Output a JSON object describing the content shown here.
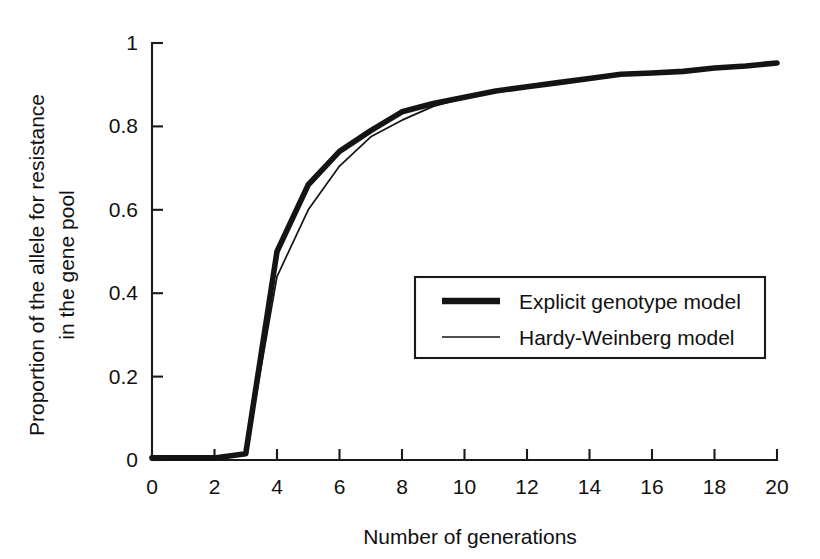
{
  "chart_data": {
    "type": "line",
    "title": "",
    "xlabel": "Number of generations",
    "ylabel": "Proportion of the allele for resistance in the gene pool",
    "ylabel_line1": "Proportion of the allele for resistance",
    "ylabel_line2": "in the gene pool",
    "xlim": [
      0,
      20
    ],
    "ylim": [
      0,
      1
    ],
    "xticks": [
      0,
      2,
      4,
      6,
      8,
      10,
      12,
      14,
      16,
      18,
      20
    ],
    "xtick_labels": [
      "0",
      "2",
      "4",
      "6",
      "8",
      "10",
      "12",
      "14",
      "16",
      "18",
      "20"
    ],
    "yticks": [
      0,
      0.2,
      0.4,
      0.6,
      0.8,
      1
    ],
    "ytick_labels": [
      "0",
      "0.2",
      "0.4",
      "0.6",
      "0.8",
      "1"
    ],
    "grid": false,
    "legend_position": "center-right",
    "x": [
      0,
      1,
      2,
      3,
      4,
      5,
      6,
      7,
      8,
      9,
      10,
      11,
      12,
      13,
      14,
      15,
      16,
      17,
      18,
      19,
      20
    ],
    "series": [
      {
        "name": "Explicit genotype model",
        "style": "thick",
        "color": "#141414",
        "values": [
          0.005,
          0.005,
          0.005,
          0.015,
          0.5,
          0.66,
          0.74,
          0.79,
          0.835,
          0.855,
          0.87,
          0.885,
          0.895,
          0.905,
          0.915,
          0.925,
          0.928,
          0.932,
          0.94,
          0.945,
          0.952
        ]
      },
      {
        "name": "Hardy-Weinberg model",
        "style": "thin",
        "color": "#141414",
        "values": [
          0.005,
          0.005,
          0.005,
          0.012,
          0.44,
          0.6,
          0.705,
          0.775,
          0.815,
          0.848,
          0.868,
          0.884,
          0.894,
          0.904,
          0.914,
          0.924,
          0.928,
          0.932,
          0.94,
          0.945,
          0.952
        ]
      }
    ],
    "legend": [
      {
        "label": "Explicit genotype model",
        "style": "thick"
      },
      {
        "label": "Hardy-Weinberg model",
        "style": "thin"
      }
    ]
  }
}
